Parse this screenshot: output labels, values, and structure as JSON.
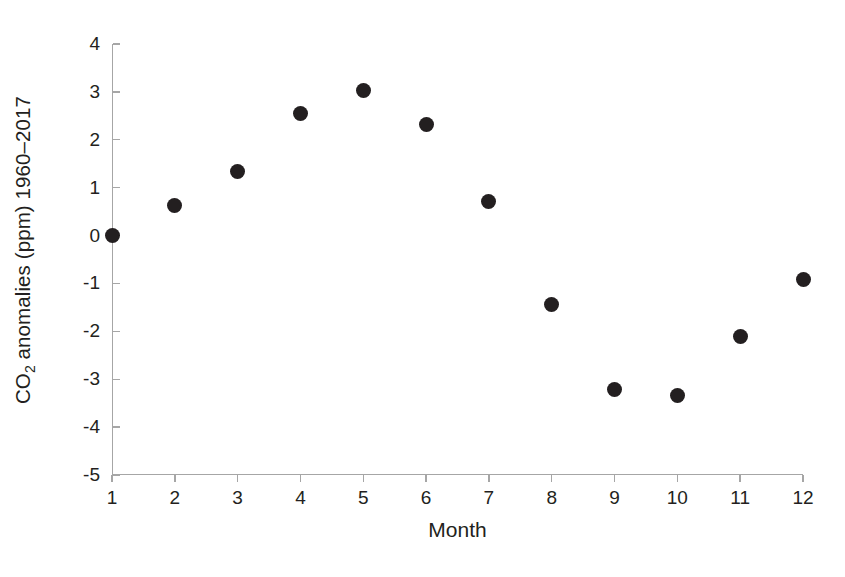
{
  "chart_data": {
    "type": "scatter",
    "title": "",
    "xlabel": "Month",
    "ylabel": "CO2 anomalies (ppm) 1960–2017",
    "ylabel_parts": {
      "prefix": "CO",
      "subscript": "2",
      "suffix": " anomalies (ppm) 1960–2017"
    },
    "x": [
      1,
      2,
      3,
      4,
      5,
      6,
      7,
      8,
      9,
      10,
      11,
      12
    ],
    "categories": [
      "1",
      "2",
      "3",
      "4",
      "5",
      "6",
      "7",
      "8",
      "9",
      "10",
      "11",
      "12"
    ],
    "values": [
      0.0,
      0.63,
      1.33,
      2.55,
      3.03,
      2.31,
      0.71,
      -1.44,
      -3.22,
      -3.35,
      -2.11,
      -0.92
    ],
    "series": [
      {
        "name": "CO2 anomalies",
        "marker": "filled-circle",
        "color": "#231f20",
        "values": [
          0.0,
          0.63,
          1.33,
          2.55,
          3.03,
          2.31,
          0.71,
          -1.44,
          -3.22,
          -3.35,
          -2.11,
          -0.92
        ]
      }
    ],
    "xlim": [
      1,
      12
    ],
    "ylim": [
      -5,
      4
    ],
    "xticks": [
      "1",
      "2",
      "3",
      "4",
      "5",
      "6",
      "7",
      "8",
      "9",
      "10",
      "11",
      "12"
    ],
    "yticks": [
      "4",
      "3",
      "2",
      "1",
      "0",
      "-1",
      "-2",
      "-3",
      "-4",
      "-5"
    ],
    "ytick_values": [
      4,
      3,
      2,
      1,
      0,
      -1,
      -2,
      -3,
      -4,
      -5
    ],
    "grid": false,
    "legend": "none",
    "axis_color": "#a6a6a6",
    "text_color": "#231f20",
    "background": "#ffffff"
  }
}
